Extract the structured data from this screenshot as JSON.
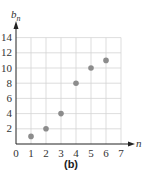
{
  "chart_data": {
    "type": "scatter",
    "title": "",
    "caption": "(b)",
    "xlabel": "n",
    "ylabel": "b_n",
    "ylabel_base": "b",
    "ylabel_sub": "n",
    "xlim": [
      0,
      7
    ],
    "ylim": [
      0,
      14
    ],
    "x_ticks": [
      0,
      1,
      2,
      3,
      4,
      5,
      6,
      7
    ],
    "y_ticks": [
      2,
      4,
      6,
      8,
      10,
      12,
      14
    ],
    "grid": true,
    "legend": null,
    "series": [
      {
        "name": "b_n",
        "x": [
          1,
          2,
          3,
          4,
          5,
          6
        ],
        "y": [
          1,
          2,
          4,
          8,
          10,
          11
        ],
        "color": "#8c8c8c"
      }
    ]
  },
  "colors": {
    "grid": "#d4d4d4",
    "axis": "#222222",
    "point": "#8c8c8c"
  }
}
